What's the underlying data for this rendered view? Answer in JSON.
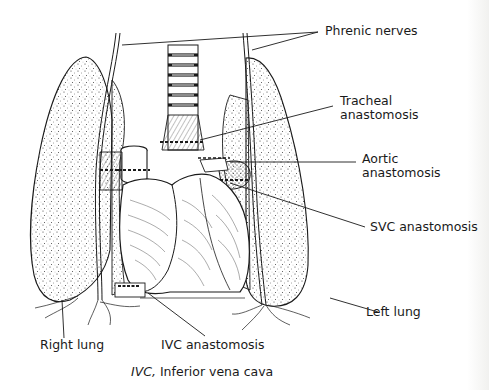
{
  "figure": {
    "labels": {
      "phrenic_nerves": "Phrenic nerves",
      "tracheal_anastomosis_line1": "Tracheal",
      "tracheal_anastomosis_line2": "anastomosis",
      "aortic_anastomosis_line1": "Aortic",
      "aortic_anastomosis_line2": "anastomosis",
      "svc_anastomosis": "SVC anastomosis",
      "left_lung": "Left lung",
      "right_lung": "Right lung",
      "ivc_anastomosis": "IVC anastomosis"
    },
    "caption": {
      "abbrev": "IVC,",
      "definition": " Inferior vena cava"
    },
    "colors": {
      "ink": "#1a1a1a",
      "background": "#ffffff"
    }
  }
}
